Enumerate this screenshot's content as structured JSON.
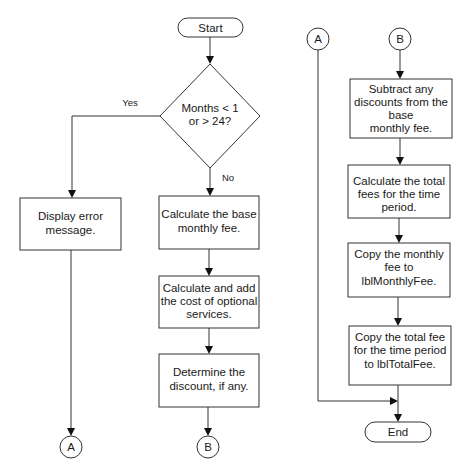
{
  "diagram": {
    "type": "flowchart",
    "colors": {
      "stroke": "#333333",
      "background": "#ffffff",
      "text": "#1a1a1a"
    },
    "start": {
      "label": "Start"
    },
    "decision": {
      "line1": "Months < 1",
      "line2": "or > 24?",
      "yes_label": "Yes",
      "no_label": "No"
    },
    "error_box": {
      "line1": "Display error",
      "line2": "message."
    },
    "steps_left": [
      {
        "line1": "Calculate the base",
        "line2": "monthly fee."
      },
      {
        "line1": "Calculate and add",
        "line2": "the cost of optional",
        "line3": "services."
      },
      {
        "line1": "Determine the",
        "line2": "discount, if any."
      }
    ],
    "connectors": {
      "a": "A",
      "b": "B"
    },
    "steps_right": [
      {
        "line1": "Subtract any",
        "line2": "discounts from the",
        "line3": "base",
        "line4": "monthly fee."
      },
      {
        "line1": "Calculate the total",
        "line2": "fees for the time",
        "line3": "period."
      },
      {
        "line1": "Copy the monthly",
        "line2": "fee to",
        "line3": "lblMonthlyFee."
      },
      {
        "line1": "Copy the total fee",
        "line2": "for the time period",
        "line3": "to lblTotalFee."
      }
    ],
    "end": {
      "label": "End"
    }
  }
}
